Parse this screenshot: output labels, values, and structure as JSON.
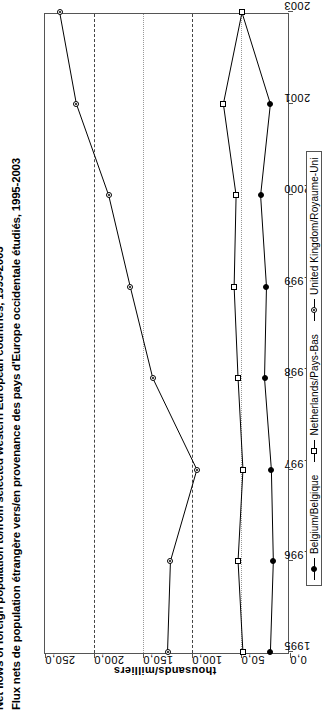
{
  "figure": {
    "title_en": "Net flows of foreign population to/from selected western European countries, 1995-2003",
    "title_fr": "Flux nets de population étrangère vers/en provenance des pays d'Europe occidentale étudiés, 1995-2003"
  },
  "axes": {
    "value_axis_title": "thousands/milliers",
    "value_ticks": [
      "250,0",
      "200,0",
      "150,0",
      "100,0",
      "50,0",
      "0,0"
    ],
    "year_ticks": [
      "1995",
      "1996",
      "1997",
      "1998",
      "1999",
      "2000",
      "2001",
      "2003"
    ]
  },
  "legend": {
    "items": [
      {
        "label": "Belgium/Belgique",
        "marker": "filled-circle",
        "color": "#000000"
      },
      {
        "label": "Netherlands/Pays-Bas",
        "marker": "open-square",
        "color": "#000000"
      },
      {
        "label": "United Kingdom/Royaume-Uni",
        "marker": "dot-circle",
        "color": "#000000"
      }
    ]
  },
  "chart_data": {
    "type": "line",
    "title": "Net flows of foreign population to/from selected western European countries, 1995-2003",
    "subtitle": "Flux nets de population étrangère vers/en provenance des pays d'Europe occidentale étudiés, 1995-2003",
    "xlabel": "",
    "ylabel": "thousands/milliers",
    "orientation": "rotated-90-ccw",
    "categories": [
      1995,
      1996,
      1997,
      1998,
      1999,
      2000,
      2001,
      2003
    ],
    "ylim": [
      0,
      250
    ],
    "ytick_values": [
      0,
      50,
      100,
      150,
      200,
      250
    ],
    "grid": "dotted-value-gridlines",
    "legend_position": "below-plot",
    "series": [
      {
        "name": "Belgium/Belgique",
        "marker": "filled-circle",
        "values": [
          20,
          17,
          19,
          26,
          24,
          30,
          20,
          49
        ]
      },
      {
        "name": "Netherlands/Pays-Bas",
        "marker": "open-square",
        "values": [
          48,
          53,
          48,
          53,
          57,
          55,
          68,
          49
        ]
      },
      {
        "name": "United Kingdom/Royaume-Uni",
        "marker": "dot-circle",
        "values": [
          125,
          122,
          95,
          140,
          163,
          185,
          218,
          235
        ]
      }
    ]
  }
}
